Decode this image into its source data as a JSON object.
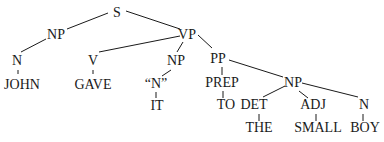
{
  "diagram": {
    "type": "parse-tree",
    "nodes": [
      {
        "id": "s",
        "label": "S",
        "x": 117,
        "y": 17
      },
      {
        "id": "np1",
        "label": "NP",
        "x": 56,
        "y": 39
      },
      {
        "id": "vp",
        "label": "VP",
        "x": 187,
        "y": 39
      },
      {
        "id": "n1",
        "label": "N",
        "x": 17,
        "y": 65
      },
      {
        "id": "john",
        "label": "JOHN",
        "x": 22,
        "y": 89
      },
      {
        "id": "v",
        "label": "V",
        "x": 93,
        "y": 65
      },
      {
        "id": "gave",
        "label": "GAVE",
        "x": 93,
        "y": 89
      },
      {
        "id": "np2",
        "label": "NP",
        "x": 176,
        "y": 65
      },
      {
        "id": "qn",
        "label": "“N”",
        "x": 156,
        "y": 88
      },
      {
        "id": "it",
        "label": "IT",
        "x": 157,
        "y": 110
      },
      {
        "id": "pp",
        "label": "PP",
        "x": 218,
        "y": 63
      },
      {
        "id": "prep",
        "label": "PREP",
        "x": 222,
        "y": 87
      },
      {
        "id": "to",
        "label": "TO",
        "x": 226,
        "y": 109
      },
      {
        "id": "np3",
        "label": "NP",
        "x": 293,
        "y": 87
      },
      {
        "id": "det",
        "label": "DET",
        "x": 254,
        "y": 109
      },
      {
        "id": "the",
        "label": "THE",
        "x": 259,
        "y": 132
      },
      {
        "id": "adj",
        "label": "ADJ",
        "x": 313,
        "y": 109
      },
      {
        "id": "small",
        "label": "SMALL",
        "x": 318,
        "y": 132
      },
      {
        "id": "n2",
        "label": "N",
        "x": 364,
        "y": 109
      },
      {
        "id": "boy",
        "label": "BOY",
        "x": 365,
        "y": 132
      }
    ],
    "edges": [
      {
        "x1": 108,
        "y1": 13,
        "x2": 67,
        "y2": 29
      },
      {
        "x1": 126,
        "y1": 11,
        "x2": 180,
        "y2": 29
      },
      {
        "x1": 46,
        "y1": 39,
        "x2": 21,
        "y2": 52
      },
      {
        "x1": 180,
        "y1": 36,
        "x2": 99,
        "y2": 52
      },
      {
        "x1": 183,
        "y1": 42,
        "x2": 177,
        "y2": 52
      },
      {
        "x1": 198,
        "y1": 35,
        "x2": 212,
        "y2": 48
      },
      {
        "x1": 18,
        "y1": 70,
        "x2": 18,
        "y2": 74
      },
      {
        "x1": 93,
        "y1": 70,
        "x2": 93,
        "y2": 74
      },
      {
        "x1": 171,
        "y1": 70,
        "x2": 162,
        "y2": 76
      },
      {
        "x1": 156,
        "y1": 92,
        "x2": 156,
        "y2": 98
      },
      {
        "x1": 222,
        "y1": 67,
        "x2": 222,
        "y2": 75
      },
      {
        "x1": 229,
        "y1": 60,
        "x2": 283,
        "y2": 77
      },
      {
        "x1": 223,
        "y1": 91,
        "x2": 223,
        "y2": 98
      },
      {
        "x1": 285,
        "y1": 86,
        "x2": 263,
        "y2": 97
      },
      {
        "x1": 299,
        "y1": 91,
        "x2": 308,
        "y2": 98
      },
      {
        "x1": 302,
        "y1": 83,
        "x2": 358,
        "y2": 97
      },
      {
        "x1": 259,
        "y1": 114,
        "x2": 259,
        "y2": 121
      },
      {
        "x1": 316,
        "y1": 114,
        "x2": 316,
        "y2": 121
      },
      {
        "x1": 363,
        "y1": 114,
        "x2": 363,
        "y2": 121
      }
    ]
  }
}
